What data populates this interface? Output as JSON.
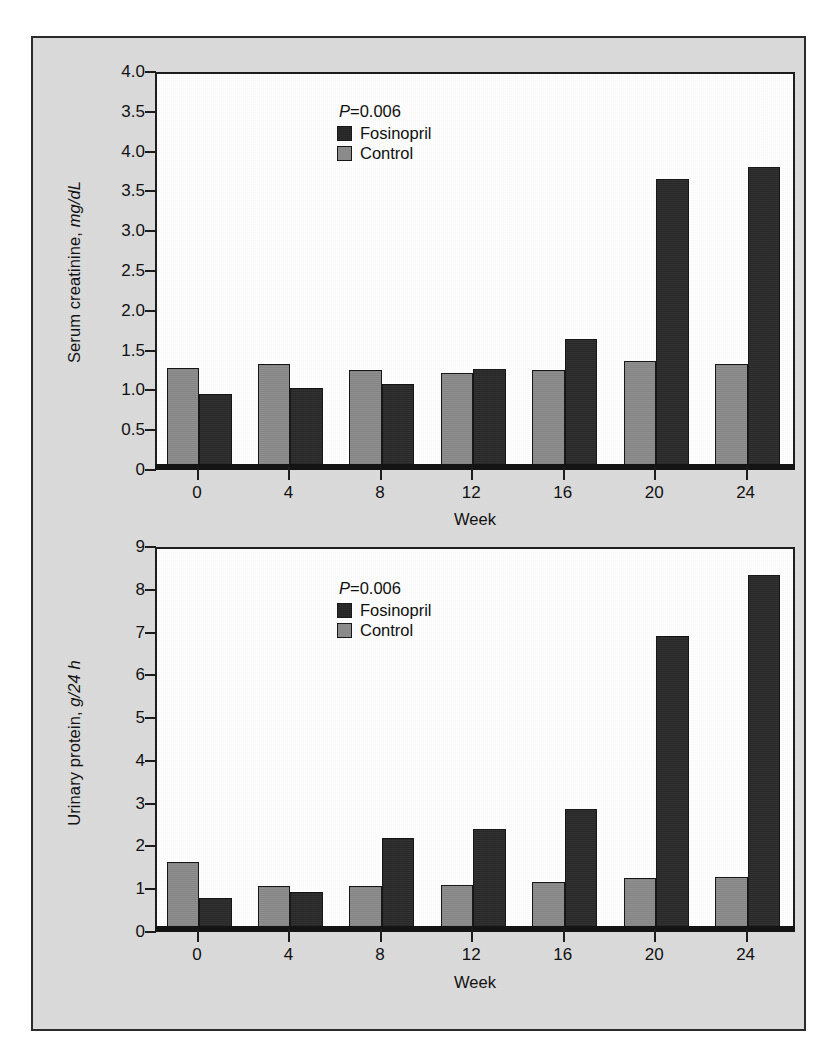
{
  "figure": {
    "background_color": "#dcdcdc",
    "border_color": "#2b2b2b",
    "plot_background_color": "#ffffff"
  },
  "colors": {
    "fosinopril": "#262626",
    "control": "#8b8b8b",
    "axis": "#1a1a1a",
    "text": "#0e0e0e"
  },
  "panels": {
    "top": {
      "legend": {
        "p_value_prefix": "P",
        "p_value_text": "=0.006",
        "series": [
          {
            "name": "fosinopril",
            "label": "Fosinopril",
            "color": "#262626"
          },
          {
            "name": "control",
            "label": "Control",
            "color": "#8b8b8b"
          }
        ]
      },
      "ylabel_main": "Serum creatinine, ",
      "ylabel_unit": "mg/dL",
      "xlabel": "Week"
    },
    "bottom": {
      "legend": {
        "p_value_prefix": "P",
        "p_value_text": "=0.006",
        "series": [
          {
            "name": "fosinopril",
            "label": "Fosinopril",
            "color": "#262626"
          },
          {
            "name": "control",
            "label": "Control",
            "color": "#8b8b8b"
          }
        ]
      },
      "ylabel_main": "Urinary protein, ",
      "ylabel_unit": "g/24 h",
      "xlabel": "Week"
    }
  },
  "chart_data": [
    {
      "type": "bar",
      "title": "Serum creatinine by week",
      "xlabel": "Week",
      "ylabel": "Serum creatinine, mg/dL",
      "categories": [
        "0",
        "4",
        "8",
        "12",
        "16",
        "20",
        "24"
      ],
      "ytick_labels": [
        "0",
        "0.5",
        "1.0",
        "1.5",
        "2.0",
        "2.5",
        "3.0",
        "3.5",
        "4.0",
        "3.5",
        "4.0"
      ],
      "ytick_values": [
        0,
        0.5,
        1.0,
        1.5,
        2.0,
        2.5,
        3.0,
        3.5,
        4.0,
        4.5,
        5.0
      ],
      "ylim": [
        0,
        5.0
      ],
      "grid": false,
      "legend_position": "top-left",
      "annotations": [
        "P=0.006"
      ],
      "series": [
        {
          "name": "Control",
          "color": "#8b8b8b",
          "values": [
            1.26,
            1.31,
            1.23,
            1.19,
            1.23,
            1.34,
            1.31
          ]
        },
        {
          "name": "Fosinopril",
          "color": "#262626",
          "values": [
            0.93,
            1.0,
            1.06,
            1.24,
            1.62,
            3.63,
            3.78
          ]
        }
      ]
    },
    {
      "type": "bar",
      "title": "Urinary protein by week",
      "xlabel": "Week",
      "ylabel": "Urinary protein, g/24 h",
      "categories": [
        "0",
        "4",
        "8",
        "12",
        "16",
        "20",
        "24"
      ],
      "ytick_labels": [
        "0",
        "1",
        "2",
        "3",
        "4",
        "5",
        "6",
        "7",
        "8",
        "9"
      ],
      "ytick_values": [
        0,
        1,
        2,
        3,
        4,
        5,
        6,
        7,
        8,
        9
      ],
      "ylim": [
        0,
        9
      ],
      "grid": false,
      "legend_position": "top-left",
      "annotations": [
        "P=0.006"
      ],
      "series": [
        {
          "name": "Control",
          "color": "#8b8b8b",
          "values": [
            1.6,
            1.04,
            1.04,
            1.06,
            1.13,
            1.21,
            1.25
          ]
        },
        {
          "name": "Fosinopril",
          "color": "#262626",
          "values": [
            0.75,
            0.9,
            2.15,
            2.36,
            2.84,
            6.88,
            8.31
          ]
        }
      ]
    }
  ]
}
